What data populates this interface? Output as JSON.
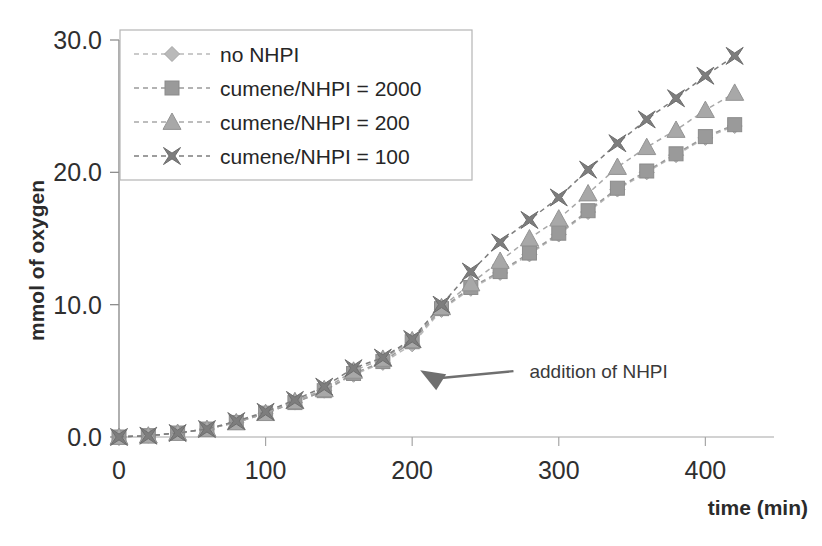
{
  "chart_data": {
    "type": "line",
    "title": "",
    "xlabel": "time (min)",
    "ylabel": "mmol of oxygen",
    "xlim": [
      0,
      440
    ],
    "ylim": [
      0,
      30
    ],
    "xticks": [
      0,
      100,
      200,
      300,
      400
    ],
    "xtick_labels": [
      "0",
      "100",
      "200",
      "300",
      "400"
    ],
    "yticks": [
      0,
      10,
      20,
      30
    ],
    "ytick_labels": [
      "0.0",
      "10.0",
      "20.0",
      "30.0"
    ],
    "grid": false,
    "legend_position": "top-left",
    "x": [
      0,
      20,
      40,
      60,
      80,
      100,
      120,
      140,
      160,
      180,
      200,
      220,
      240,
      260,
      280,
      300,
      320,
      340,
      360,
      380,
      400,
      420
    ],
    "series": [
      {
        "name": "no NHPI",
        "marker": "diamond",
        "color": "#b9b9b9",
        "values": [
          0.0,
          0.1,
          0.3,
          0.6,
          1.1,
          1.8,
          2.6,
          3.5,
          4.7,
          5.6,
          7.0,
          9.6,
          11.2,
          12.4,
          13.8,
          15.3,
          17.0,
          18.7,
          20.0,
          21.3,
          22.6,
          23.5
        ]
      },
      {
        "name": "cumene/NHPI = 2000",
        "marker": "square",
        "color": "#9a9a9a",
        "values": [
          0.0,
          0.1,
          0.3,
          0.6,
          1.1,
          1.8,
          2.6,
          3.5,
          4.8,
          5.7,
          7.2,
          9.7,
          11.3,
          12.5,
          13.9,
          15.4,
          17.1,
          18.8,
          20.1,
          21.4,
          22.7,
          23.6
        ]
      },
      {
        "name": "cumene/NHPI = 200",
        "marker": "triangle",
        "color": "#a8a8a8",
        "values": [
          0.0,
          0.1,
          0.3,
          0.6,
          1.1,
          1.8,
          2.7,
          3.6,
          5.0,
          5.9,
          7.3,
          9.8,
          11.6,
          13.3,
          15.0,
          16.5,
          18.4,
          20.4,
          21.9,
          23.2,
          24.7,
          26.0
        ]
      },
      {
        "name": "cumene/NHPI = 100",
        "marker": "x",
        "color": "#7d7d7d",
        "values": [
          0.0,
          0.1,
          0.3,
          0.6,
          1.2,
          1.9,
          2.8,
          3.8,
          5.2,
          6.0,
          7.4,
          10.0,
          12.5,
          14.7,
          16.4,
          18.1,
          20.2,
          22.2,
          24.0,
          25.6,
          27.3,
          28.8
        ]
      }
    ],
    "annotations": [
      {
        "text": "addition of NHPI",
        "x": 200,
        "y": 5.5,
        "label_x": 265,
        "label_y": 4.6
      }
    ]
  },
  "legend": {
    "items": [
      {
        "label": "no NHPI"
      },
      {
        "label": "cumene/NHPI = 2000"
      },
      {
        "label": "cumene/NHPI = 200"
      },
      {
        "label": "cumene/NHPI = 100"
      }
    ]
  }
}
